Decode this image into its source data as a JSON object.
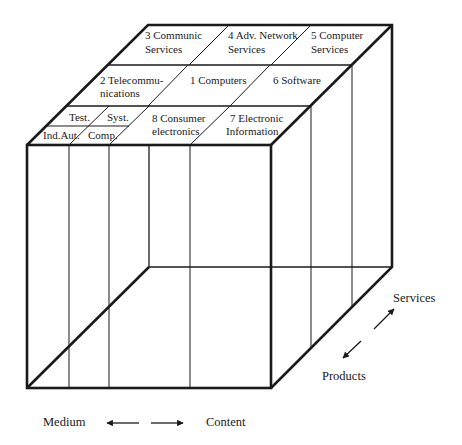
{
  "diagram": {
    "type": "3d-cube-segmentation",
    "top_cells": [
      {
        "id": "cell-3",
        "lines": [
          "3 Communic",
          "Services"
        ]
      },
      {
        "id": "cell-4",
        "lines": [
          "4 Adv. Network",
          "Services"
        ]
      },
      {
        "id": "cell-5",
        "lines": [
          "5 Computer",
          "Services"
        ]
      },
      {
        "id": "cell-2",
        "lines": [
          "2 Telecommu-",
          "nications"
        ]
      },
      {
        "id": "cell-1",
        "lines": [
          "1 Computers"
        ]
      },
      {
        "id": "cell-6",
        "lines": [
          "6 Software"
        ]
      },
      {
        "id": "cell-test",
        "lines": [
          "Test."
        ]
      },
      {
        "id": "cell-syst",
        "lines": [
          "Syst."
        ]
      },
      {
        "id": "cell-indaut",
        "lines": [
          "Ind.Aut."
        ]
      },
      {
        "id": "cell-comp",
        "lines": [
          "Comp."
        ]
      },
      {
        "id": "cell-8",
        "lines": [
          "8 Consumer",
          "electronics"
        ]
      },
      {
        "id": "cell-7",
        "lines": [
          "7 Electronic",
          "Information"
        ]
      }
    ],
    "axes": {
      "horizontal": {
        "left": "Medium",
        "right": "Content"
      },
      "depth": {
        "back": "Services",
        "front": "Products"
      }
    },
    "colors": {
      "line": "#1a1a1a",
      "background": "#ffffff"
    }
  }
}
